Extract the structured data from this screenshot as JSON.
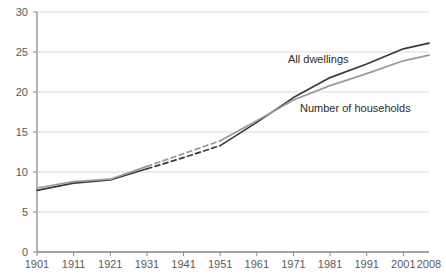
{
  "chart_data": {
    "type": "line",
    "title": "",
    "subtitle": "",
    "xlabel": "",
    "ylabel": "",
    "xlim": [
      1901,
      2008
    ],
    "ylim": [
      0,
      30
    ],
    "grid": true,
    "gridlines_y": [
      0,
      5,
      10,
      15,
      20,
      25,
      30
    ],
    "legend_position": "inline-annotation",
    "x_tick_labels": [
      "1901",
      "1911",
      "1921",
      "1931",
      "1941",
      "1951",
      "1961",
      "1971",
      "1981",
      "1991",
      "2001",
      "2008"
    ],
    "y_tick_labels": [
      "0",
      "5",
      "10",
      "15",
      "20",
      "25",
      "30"
    ],
    "x": [
      1901,
      1911,
      1921,
      1931,
      1941,
      1951,
      1961,
      1971,
      1981,
      1991,
      2001,
      2008
    ],
    "series": [
      {
        "name": "All dwellings",
        "color": "#3a3a3a",
        "dashed_span": [
          1931,
          1951
        ],
        "values": [
          7.7,
          8.6,
          9.0,
          10.4,
          11.8,
          13.3,
          16.2,
          19.3,
          21.8,
          23.5,
          25.4,
          26.1
        ]
      },
      {
        "name": "Number of households",
        "color": "#999999",
        "dashed_span": [
          1931,
          1951
        ],
        "values": [
          8.0,
          8.8,
          9.1,
          10.7,
          12.3,
          13.9,
          16.4,
          19.0,
          20.8,
          22.3,
          23.9,
          24.6
        ]
      }
    ],
    "annotations": [
      {
        "text": "All dwellings",
        "x_px": 288,
        "y_px": 54
      },
      {
        "text": "Number of households",
        "x_px": 300,
        "y_px": 103
      }
    ],
    "colors": {
      "axis": "#8c8c8c",
      "grid": "#d9d9d9",
      "tick_text": "#5a5a5a",
      "annotation_text": "#2b2b2b",
      "background": "#ffffff"
    },
    "geometry": {
      "plot_left": 37,
      "plot_right": 429,
      "plot_top": 12,
      "plot_bottom": 252
    }
  }
}
